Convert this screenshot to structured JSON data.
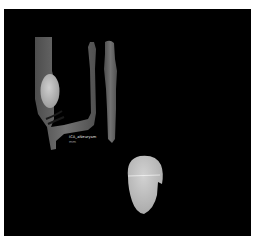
{
  "viewer": {
    "background": "#000000",
    "frame_color": "#ffffff"
  },
  "annotation": {
    "label": "ICA_aNeurysm",
    "sub_label": "mm"
  },
  "colors": {
    "vessel": "#6e6e6e",
    "vessel_dark": "#5a5a5a",
    "aneurysm": "#bdbdbd",
    "lower_sac": "#c4c4c4",
    "measure_line": "#ffffff"
  }
}
